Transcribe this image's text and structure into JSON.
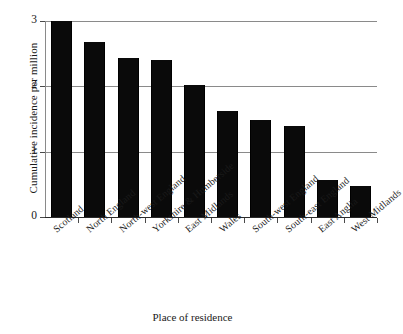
{
  "chart_data": {
    "type": "bar",
    "title": "",
    "xlabel": "Place of residence",
    "ylabel": "Cumulative incidence per million",
    "categories": [
      "Scotland",
      "North England",
      "North-west England",
      "Yorkshire & Humberside",
      "East Midlands",
      "Wales",
      "South-west England",
      "South-east England",
      "East Anglia",
      "West Midlands"
    ],
    "values": [
      3.0,
      2.68,
      2.43,
      2.41,
      2.02,
      1.62,
      1.48,
      1.39,
      0.57,
      0.47
    ],
    "ylim": [
      0,
      3
    ],
    "yticks": [
      "0",
      "1",
      "2",
      "3"
    ],
    "ytick_values": [
      0,
      1,
      2,
      3
    ],
    "grid": true,
    "legend": "none",
    "bar_color": "#0a0a0a",
    "gridline_color": "#8a8a8a",
    "background_color": "#ffffff"
  }
}
